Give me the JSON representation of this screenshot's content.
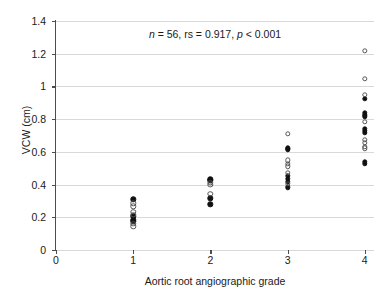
{
  "chart_data": {
    "type": "scatter",
    "title": "",
    "xlabel": "Aortic root angiographic grade",
    "ylabel": "VCW (cm)",
    "xlim": [
      0,
      4.12
    ],
    "ylim": [
      0,
      1.4
    ],
    "xticks": [
      "0",
      "1",
      "2",
      "3",
      "4"
    ],
    "xtick_values": [
      0,
      1,
      2,
      3,
      4
    ],
    "yticks": [
      "0",
      "0.2",
      "0.4",
      "0.6",
      "0.8",
      "1",
      "1.2",
      "1.4"
    ],
    "ytick_values": [
      0,
      0.2,
      0.4,
      0.6,
      0.8,
      1.0,
      1.2,
      1.4
    ],
    "grid": "horizontal",
    "legend": "none",
    "annotation": {
      "text": "n = 56, rs = 0.917, p < 0.001",
      "n_label": "n",
      "n_value": " = 56, rs = 0.917, ",
      "p_label": "p",
      "p_value": " < 0.001"
    },
    "series": [
      {
        "name": "filled",
        "marker": "filled-circle",
        "color": "#111111",
        "points": [
          {
            "x": 1,
            "y": 0.31
          },
          {
            "x": 1,
            "y": 0.205
          },
          {
            "x": 1,
            "y": 0.185
          },
          {
            "x": 1,
            "y": 0.175
          },
          {
            "x": 2,
            "y": 0.432
          },
          {
            "x": 2,
            "y": 0.425
          },
          {
            "x": 2,
            "y": 0.315
          },
          {
            "x": 2,
            "y": 0.28
          },
          {
            "x": 3,
            "y": 0.622
          },
          {
            "x": 3,
            "y": 0.615
          },
          {
            "x": 3,
            "y": 0.455
          },
          {
            "x": 3,
            "y": 0.435
          },
          {
            "x": 3,
            "y": 0.418
          },
          {
            "x": 3,
            "y": 0.383
          },
          {
            "x": 4,
            "y": 0.925
          },
          {
            "x": 4,
            "y": 0.838
          },
          {
            "x": 4,
            "y": 0.828
          },
          {
            "x": 4,
            "y": 0.818
          },
          {
            "x": 4,
            "y": 0.742
          },
          {
            "x": 4,
            "y": 0.728
          },
          {
            "x": 4,
            "y": 0.718
          },
          {
            "x": 4,
            "y": 0.538
          },
          {
            "x": 4,
            "y": 0.528
          }
        ]
      },
      {
        "name": "open",
        "marker": "open-circle",
        "color": "#555555",
        "points": [
          {
            "x": 1,
            "y": 0.285
          },
          {
            "x": 1,
            "y": 0.268
          },
          {
            "x": 1,
            "y": 0.232
          },
          {
            "x": 1,
            "y": 0.215
          },
          {
            "x": 1,
            "y": 0.162
          },
          {
            "x": 1,
            "y": 0.145
          },
          {
            "x": 2,
            "y": 0.412
          },
          {
            "x": 2,
            "y": 0.398
          },
          {
            "x": 2,
            "y": 0.345
          },
          {
            "x": 3,
            "y": 0.712
          },
          {
            "x": 3,
            "y": 0.548
          },
          {
            "x": 3,
            "y": 0.528
          },
          {
            "x": 3,
            "y": 0.512
          },
          {
            "x": 3,
            "y": 0.472
          },
          {
            "x": 3,
            "y": 0.405
          },
          {
            "x": 4,
            "y": 1.218
          },
          {
            "x": 4,
            "y": 1.048
          },
          {
            "x": 4,
            "y": 0.948
          },
          {
            "x": 4,
            "y": 0.782
          },
          {
            "x": 4,
            "y": 0.675
          },
          {
            "x": 4,
            "y": 0.655
          },
          {
            "x": 4,
            "y": 0.632
          },
          {
            "x": 4,
            "y": 0.622
          }
        ]
      }
    ]
  }
}
